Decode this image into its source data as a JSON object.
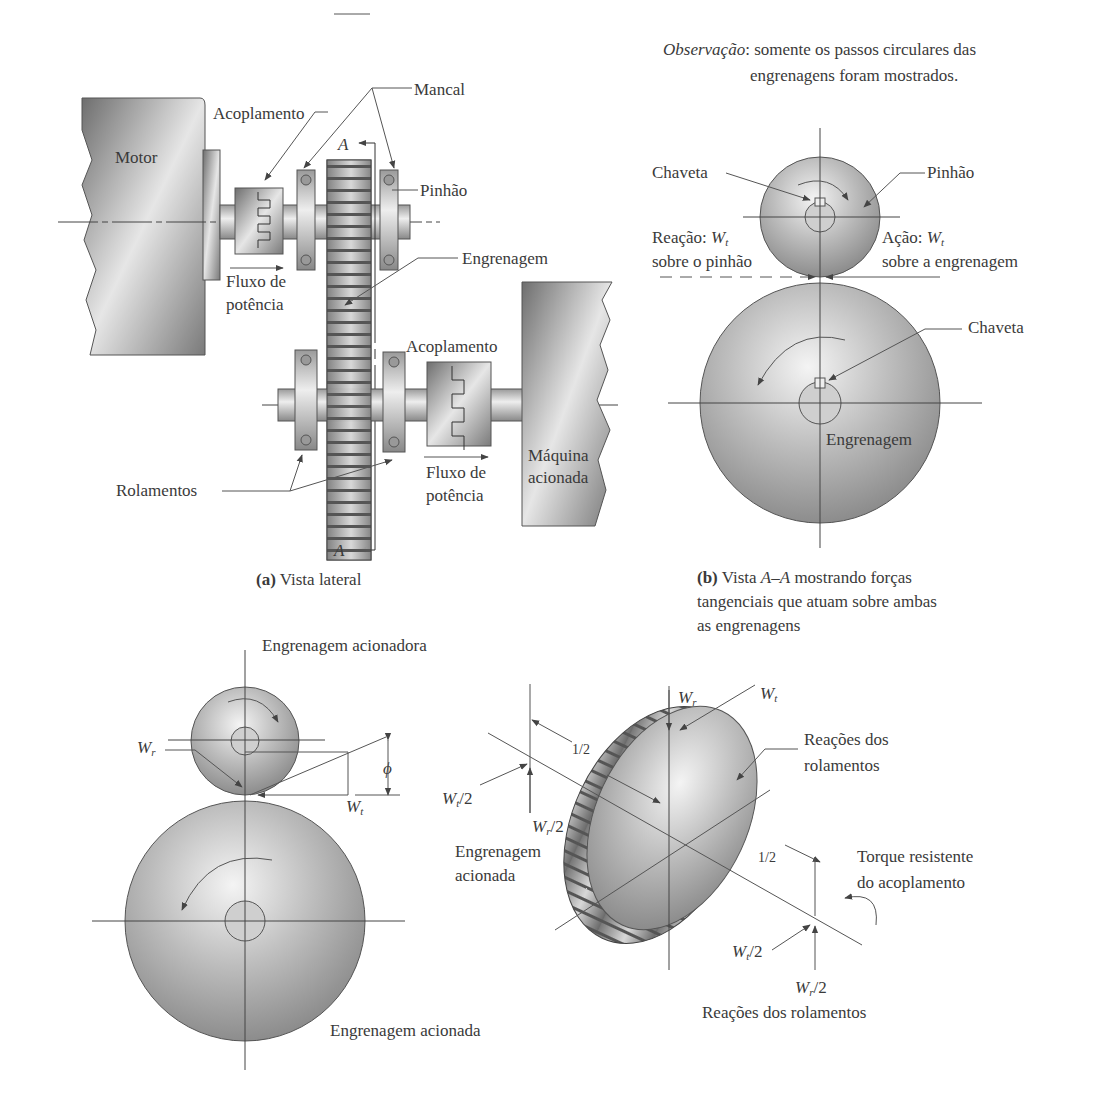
{
  "figure": {
    "note": {
      "prefix": "Observação",
      "line1": ": somente os passos circulares das",
      "line2": "engrenagens foram mostrados."
    },
    "panel_a": {
      "caption_letter": "(a)",
      "caption_text": " Vista lateral",
      "labels": {
        "motor": "Motor",
        "coupling_top": "Acoplamento",
        "bearing": "Mancal",
        "pinion": "Pinhão",
        "gear": "Engrenagem",
        "coupling_bottom": "Acoplamento",
        "flow1_line1": "Fluxo de",
        "flow1_line2": "potência",
        "flow2_line1": "Fluxo de",
        "flow2_line2": "potência",
        "bearings": "Rolamentos",
        "driven_machine_line1": "Máquina",
        "driven_machine_line2": "acionada",
        "section_top": "A",
        "section_bottom": "A"
      }
    },
    "panel_b": {
      "caption_letter": "(b)",
      "caption_pre": " Vista ",
      "caption_section": "A–A",
      "caption_line1_post": " mostrando forças",
      "caption_line2": "tangenciais que atuam sobre ambas",
      "caption_line3": "as engrenagens",
      "labels": {
        "key_top": "Chaveta",
        "pinion": "Pinhão",
        "reaction_prefix": "Reação: ",
        "reaction_symbol": "W",
        "reaction_sub": "t",
        "reaction_line2": "sobre o pinhão",
        "action_prefix": "Ação: ",
        "action_symbol": "W",
        "action_sub": "t",
        "action_line2": "sobre a engrenagem",
        "key_bottom": "Chaveta",
        "gear": "Engrenagem"
      }
    },
    "panel_c": {
      "labels": {
        "driving_gear": "Engrenagem acionadora",
        "driven_gear": "Engrenagem acionada",
        "wr_symbol": "W",
        "wr_sub": "r",
        "wt_symbol": "W",
        "wt_sub": "t",
        "phi": "ϕ"
      }
    },
    "panel_d": {
      "labels": {
        "wr_symbol": "W",
        "wr_sub": "r",
        "wt_symbol": "W",
        "wt_sub": "t",
        "half_top": "1/2",
        "half_bottom": "1/2",
        "left_wt_half": "/2",
        "left_wr_half": "/2",
        "right_wt_half": "/2",
        "right_wr_half": "/2",
        "driven_gear_line1": "Engrenagem",
        "driven_gear_line2": "acionada",
        "bearing_reactions_line1": "Reações dos",
        "bearing_reactions_line2": "rolamentos",
        "torque_line1": "Torque resistente",
        "torque_line2": "do acoplamento",
        "bearing_reactions_bottom": "Reações dos rolamentos"
      }
    }
  }
}
